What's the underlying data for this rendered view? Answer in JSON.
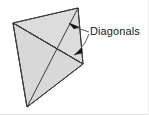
{
  "figure": {
    "title": "Diagonals",
    "background_color": "#ffffff",
    "outline_color": "#3a3a3a",
    "label": {
      "text": "Diagonals",
      "color": "#1b1b1b",
      "x": 90,
      "y": 25
    },
    "shape": {
      "name": "quadrilateral",
      "vertices": [
        {
          "name": "left",
          "x": 13,
          "y": 23
        },
        {
          "name": "top",
          "x": 78,
          "y": 8
        },
        {
          "name": "right",
          "x": 83,
          "y": 64
        },
        {
          "name": "bottom",
          "x": 27,
          "y": 107
        }
      ],
      "faces": [
        {
          "name": "upper-face",
          "points": "13,23 78,8 83,64",
          "fill": "#dcdcdc"
        },
        {
          "name": "lower-face",
          "points": "13,23 83,64 27,107",
          "fill": "#d2d2d2"
        },
        {
          "name": "left-face",
          "points": "13,23 27,107 83,64",
          "fill": "#d8d8d8"
        }
      ],
      "outline_points": "13,23 78,8 83,64 27,107"
    },
    "diagonals": [
      {
        "name": "diagonal-left-right",
        "x1": 13,
        "y1": 23,
        "x2": 83,
        "y2": 64
      },
      {
        "name": "diagonal-top-bottom",
        "x1": 78,
        "y1": 8,
        "x2": 27,
        "y2": 107
      }
    ],
    "leaders": [
      {
        "name": "leader-upper",
        "path": "M 89,32 L 80,29 L 71,25",
        "arrow_points": "69,23 79,27 74,29"
      },
      {
        "name": "leader-lower",
        "path": "M 89,34 L 85,43 L 78,52",
        "arrow_points": "74,55 82,48 82,53"
      }
    ]
  }
}
